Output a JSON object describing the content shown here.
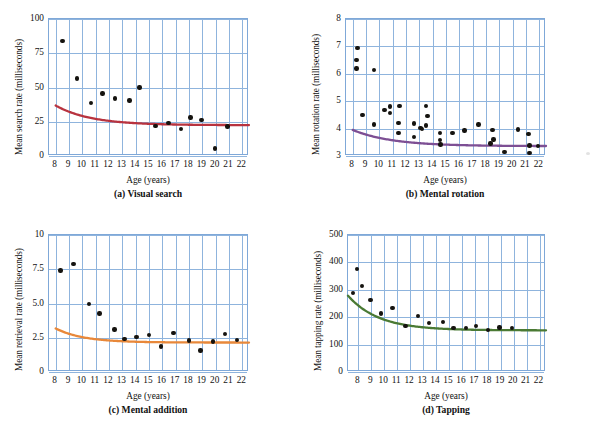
{
  "figure": {
    "background": "#ffffff",
    "grid_color": "#8fb4dd",
    "dot_color": "#15130f"
  },
  "chart_data": [
    {
      "id": "a",
      "type": "scatter",
      "title": "(a) Visual search",
      "xlabel": "Age (years)",
      "ylabel": "Mean search rate (milliseconds)",
      "xlim": [
        7.5,
        22.5
      ],
      "ylim": [
        0,
        100
      ],
      "xticks": [
        8,
        9,
        10,
        11,
        12,
        13,
        14,
        15,
        16,
        17,
        18,
        19,
        20,
        21,
        22
      ],
      "yticks": [
        0,
        25,
        50,
        75,
        100
      ],
      "grid": true,
      "curve_color": "#b8333f",
      "curve_label": "fitted decay curve",
      "points": [
        {
          "x": 8.5,
          "y": 84
        },
        {
          "x": 9.6,
          "y": 56.5
        },
        {
          "x": 10.65,
          "y": 38.5
        },
        {
          "x": 11.5,
          "y": 45.5
        },
        {
          "x": 12.45,
          "y": 42
        },
        {
          "x": 13.55,
          "y": 40.5
        },
        {
          "x": 14.3,
          "y": 50
        },
        {
          "x": 15.5,
          "y": 22
        },
        {
          "x": 16.45,
          "y": 24
        },
        {
          "x": 17.4,
          "y": 19.5
        },
        {
          "x": 18.1,
          "y": 28
        },
        {
          "x": 18.95,
          "y": 26.5
        },
        {
          "x": 19.95,
          "y": 5.5
        },
        {
          "x": 20.9,
          "y": 21.5
        }
      ],
      "curve": {
        "asymptote": 22.5,
        "amplitude": 300,
        "rate": 0.38,
        "x0": 8
      }
    },
    {
      "id": "b",
      "type": "scatter",
      "title": "(b) Mental rotation",
      "xlabel": "Age (years)",
      "ylabel": "Mean rotation rate (milliseconds)",
      "xlim": [
        7.5,
        22.5
      ],
      "ylim": [
        3,
        8
      ],
      "xticks": [
        8,
        9,
        10,
        11,
        12,
        13,
        14,
        15,
        16,
        17,
        18,
        19,
        20,
        21,
        22
      ],
      "yticks": [
        3,
        4,
        5,
        6,
        7,
        8
      ],
      "grid": true,
      "curve_color": "#7d4f94",
      "curve_label": "fitted decay curve",
      "points": [
        {
          "x": 8.35,
          "y": 6.95
        },
        {
          "x": 8.3,
          "y": 6.5
        },
        {
          "x": 8.3,
          "y": 6.2
        },
        {
          "x": 9.6,
          "y": 6.15
        },
        {
          "x": 8.75,
          "y": 4.5
        },
        {
          "x": 9.6,
          "y": 4.15
        },
        {
          "x": 10.4,
          "y": 4.68
        },
        {
          "x": 10.8,
          "y": 4.8
        },
        {
          "x": 10.8,
          "y": 4.57
        },
        {
          "x": 11.5,
          "y": 4.83
        },
        {
          "x": 11.45,
          "y": 4.2
        },
        {
          "x": 11.45,
          "y": 3.85
        },
        {
          "x": 12.6,
          "y": 4.18
        },
        {
          "x": 12.6,
          "y": 3.7
        },
        {
          "x": 13.1,
          "y": 4.02
        },
        {
          "x": 13.2,
          "y": 3.98
        },
        {
          "x": 13.5,
          "y": 4.12
        },
        {
          "x": 13.5,
          "y": 4.82
        },
        {
          "x": 13.6,
          "y": 4.45
        },
        {
          "x": 14.55,
          "y": 3.85
        },
        {
          "x": 14.55,
          "y": 3.58
        },
        {
          "x": 14.6,
          "y": 3.42
        },
        {
          "x": 15.5,
          "y": 3.85
        },
        {
          "x": 16.4,
          "y": 3.93
        },
        {
          "x": 17.45,
          "y": 4.15
        },
        {
          "x": 18.35,
          "y": 3.45
        },
        {
          "x": 18.5,
          "y": 3.95
        },
        {
          "x": 18.55,
          "y": 3.6
        },
        {
          "x": 19.4,
          "y": 3.15
        },
        {
          "x": 20.4,
          "y": 3.97
        },
        {
          "x": 21.2,
          "y": 3.8
        },
        {
          "x": 21.25,
          "y": 3.38
        },
        {
          "x": 21.25,
          "y": 3.1
        },
        {
          "x": 21.9,
          "y": 3.37
        }
      ],
      "curve": {
        "asymptote": 3.36,
        "amplitude": 9.0,
        "rate": 0.34,
        "x0": 8
      }
    },
    {
      "id": "c",
      "type": "scatter",
      "title": "(c) Mental addition",
      "xlabel": "Age (years)",
      "ylabel": "Mean retrieval rate (milliseconds)",
      "xlim": [
        7.5,
        22.5
      ],
      "ylim": [
        0,
        10
      ],
      "xticks": [
        8,
        9,
        10,
        11,
        12,
        13,
        14,
        15,
        16,
        17,
        18,
        19,
        20,
        21,
        22
      ],
      "yticks": [
        "0",
        "2.5",
        "5.0",
        "7.5",
        "10"
      ],
      "ytickvals": [
        0,
        2.5,
        5.0,
        7.5,
        10
      ],
      "grid": true,
      "curve_color": "#e8883a",
      "curve_label": "fitted decay curve",
      "points": [
        {
          "x": 8.35,
          "y": 7.42
        },
        {
          "x": 9.35,
          "y": 7.9
        },
        {
          "x": 10.5,
          "y": 4.97
        },
        {
          "x": 11.3,
          "y": 4.28
        },
        {
          "x": 12.4,
          "y": 3.1
        },
        {
          "x": 13.15,
          "y": 2.4
        },
        {
          "x": 14.05,
          "y": 2.57
        },
        {
          "x": 15.0,
          "y": 2.72
        },
        {
          "x": 15.9,
          "y": 1.85
        },
        {
          "x": 16.85,
          "y": 2.85
        },
        {
          "x": 18.0,
          "y": 2.3
        },
        {
          "x": 18.85,
          "y": 1.58
        },
        {
          "x": 19.8,
          "y": 2.22
        },
        {
          "x": 20.7,
          "y": 2.78
        },
        {
          "x": 21.6,
          "y": 2.32
        }
      ],
      "curve": {
        "asymptote": 2.15,
        "amplitude": 48,
        "rate": 0.48,
        "x0": 8
      }
    },
    {
      "id": "d",
      "type": "scatter",
      "title": "(d) Tapping",
      "xlabel": "Age (years)",
      "ylabel": "Mean tapping rate (milliseconds)",
      "xlim": [
        7.2,
        22.5
      ],
      "ylim": [
        0,
        500
      ],
      "xticks": [
        8,
        9,
        10,
        11,
        12,
        13,
        14,
        15,
        16,
        17,
        18,
        19,
        20,
        21,
        22
      ],
      "yticks": [
        0,
        100,
        200,
        300,
        400,
        500
      ],
      "grid": true,
      "curve_color": "#4a7a34",
      "curve_label": "fitted decay curve",
      "points": [
        {
          "x": 7.6,
          "y": 288
        },
        {
          "x": 7.9,
          "y": 377
        },
        {
          "x": 8.3,
          "y": 313
        },
        {
          "x": 8.95,
          "y": 263
        },
        {
          "x": 9.75,
          "y": 214
        },
        {
          "x": 10.65,
          "y": 234
        },
        {
          "x": 11.65,
          "y": 168
        },
        {
          "x": 12.6,
          "y": 205
        },
        {
          "x": 13.45,
          "y": 178
        },
        {
          "x": 14.55,
          "y": 183
        },
        {
          "x": 15.35,
          "y": 160
        },
        {
          "x": 16.3,
          "y": 160
        },
        {
          "x": 17.1,
          "y": 167
        },
        {
          "x": 18.0,
          "y": 153
        },
        {
          "x": 18.9,
          "y": 163
        },
        {
          "x": 19.85,
          "y": 160
        }
      ],
      "curve": {
        "asymptote": 152,
        "amplitude": 2600,
        "rate": 0.42,
        "x0": 7.2
      }
    }
  ]
}
